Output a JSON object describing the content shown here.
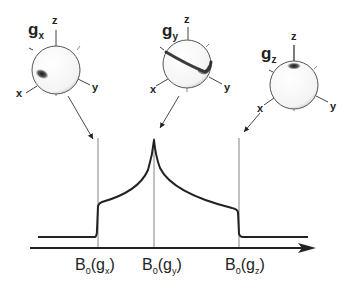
{
  "diagram": {
    "type": "EPR powder spectrum with g-tensor orientation spheres",
    "spheres": [
      {
        "id": "gx",
        "label_main": "g",
        "label_sub": "x",
        "axes": {
          "z": "z",
          "x": "x",
          "y": "y"
        }
      },
      {
        "id": "gy",
        "label_main": "g",
        "label_sub": "y",
        "axes": {
          "z": "z",
          "x": "x",
          "y": "y"
        }
      },
      {
        "id": "gz",
        "label_main": "g",
        "label_sub": "z",
        "axes": {
          "z": "z",
          "x": "x",
          "y": "y"
        }
      }
    ],
    "field_labels": [
      {
        "main": "B",
        "sub0": "0",
        "open": "(g",
        "sub": "x",
        "close": ")"
      },
      {
        "main": "B",
        "sub0": "0",
        "open": "(g",
        "sub": "y",
        "close": ")"
      },
      {
        "main": "B",
        "sub0": "0",
        "open": "(g",
        "sub": "z",
        "close": ")"
      }
    ],
    "colors": {
      "line": "#222222",
      "guide": "#555555",
      "sphere_fill": "#ffffff"
    }
  }
}
